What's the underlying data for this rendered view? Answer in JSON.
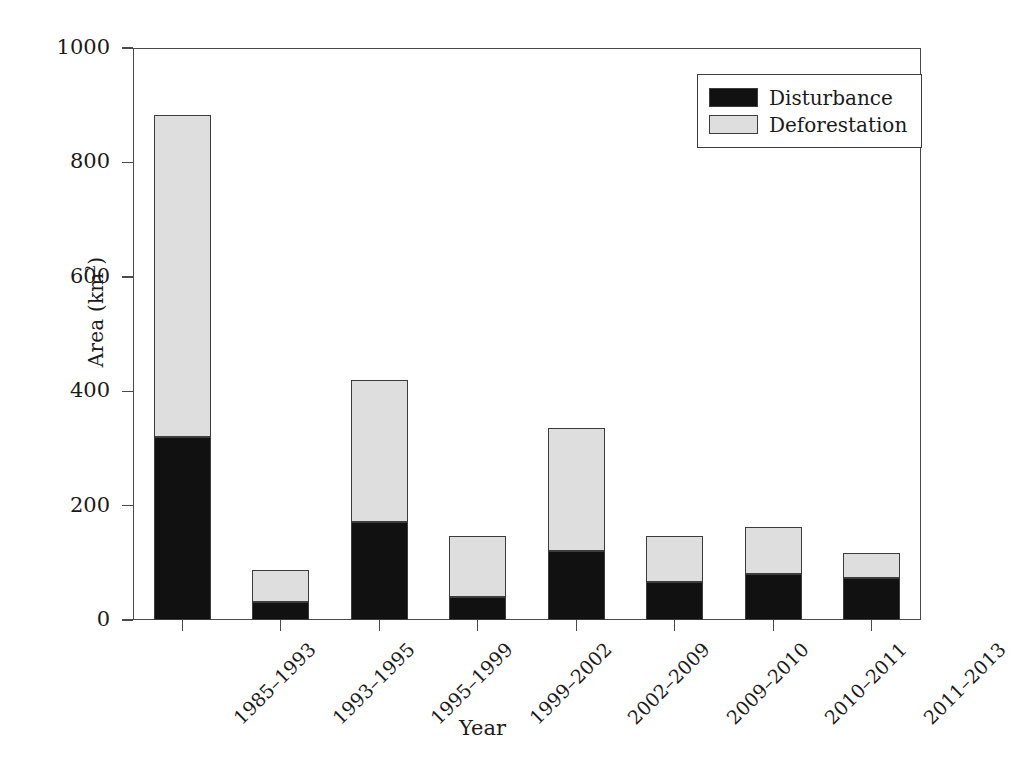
{
  "chart_data": {
    "type": "bar",
    "subtype": "stacked-bar",
    "title": "",
    "xlabel": "Year",
    "ylabel": "Area (km2)",
    "ylabel_html": "Area (km<sup>2</sup>)",
    "ylim": [
      0,
      1000
    ],
    "yticks": [
      0,
      200,
      400,
      600,
      800,
      1000
    ],
    "ytick_labels": [
      "0",
      "200",
      "400",
      "600",
      "800",
      "1000"
    ],
    "grid": false,
    "legend_position": "top-right",
    "categories": [
      "1985–1993",
      "1993–1995",
      "1995–1999",
      "1999–2002",
      "2002–2009",
      "2009–2010",
      "2010–2011",
      "2011–2013"
    ],
    "series": [
      {
        "name": "Disturbance",
        "color": "#111111",
        "values": [
          320,
          31,
          172,
          41,
          120,
          66,
          80,
          73
        ]
      },
      {
        "name": "Deforestation",
        "color": "#dedede",
        "values": [
          563,
          57,
          248,
          106,
          215,
          81,
          83,
          45
        ]
      }
    ],
    "totals": [
      883,
      88,
      420,
      147,
      335,
      147,
      163,
      118
    ]
  },
  "legend": {
    "items": [
      {
        "label": "Disturbance",
        "color": "#111111"
      },
      {
        "label": "Deforestation",
        "color": "#dedede"
      }
    ]
  }
}
